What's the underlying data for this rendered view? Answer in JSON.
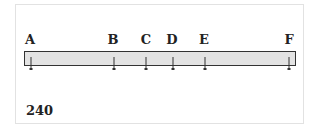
{
  "diagram": {
    "points": [
      {
        "label": "A",
        "x": 30
      },
      {
        "label": "B",
        "x": 113
      },
      {
        "label": "C",
        "x": 146
      },
      {
        "label": "D",
        "x": 172
      },
      {
        "label": "E",
        "x": 204
      },
      {
        "label": "F",
        "x": 289
      }
    ],
    "caption": "240",
    "bar_color": "#e3e3e3",
    "border_color": "#333333"
  }
}
